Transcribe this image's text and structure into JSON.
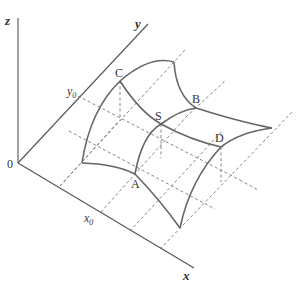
{
  "figure": {
    "title": "",
    "type": "saddle surface diagram",
    "axes": {
      "z": {
        "label": "z"
      },
      "y": {
        "label": "y"
      },
      "x": {
        "label": "x"
      },
      "origin": {
        "label": "0"
      }
    },
    "ticks": {
      "x0": {
        "base": "x",
        "sub": "0"
      },
      "y0": {
        "base": "y",
        "sub": "0"
      }
    },
    "points": {
      "A": "A",
      "B": "B",
      "C": "C",
      "D": "D",
      "S": "S"
    },
    "colors": {
      "axis": "#555555",
      "curve": "#666666",
      "dashed": "#777777",
      "text": "#333333"
    }
  }
}
